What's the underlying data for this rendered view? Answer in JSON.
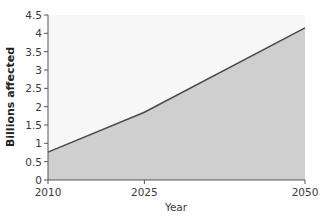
{
  "chart_data": {
    "type": "area",
    "title": "",
    "xlabel": "Year",
    "ylabel": "Billions affected",
    "x": [
      2010,
      2025,
      2050
    ],
    "values": [
      0.76,
      1.85,
      4.15
    ],
    "xticks": [
      "2010",
      "2025",
      "2050"
    ],
    "yticks": [
      "0",
      "0.5",
      "1",
      "1.5",
      "2",
      "2.5",
      "3",
      "3.5",
      "4",
      "4.5"
    ],
    "ylim": [
      0,
      4.5
    ],
    "grid": false,
    "legend": null,
    "colors": {
      "area_fill": "#cfcfcf",
      "line": "#4a4a4a",
      "plot_bg": "#f7f7f7"
    }
  }
}
